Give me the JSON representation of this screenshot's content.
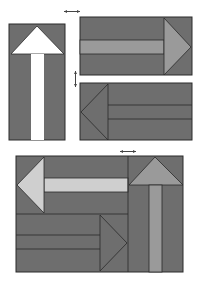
{
  "diagram": {
    "title": "",
    "colors": {
      "background": "#ffffff",
      "panel": "#6e6e6e",
      "outline": "#2a2a2a",
      "white_arrow": "#ffffff",
      "mid_arrow": "#9a9a9a",
      "light_arrow": "#cfcfcf",
      "marker": "#444444"
    },
    "panels": [
      {
        "id": "up-arrow-panel",
        "arrow": "up",
        "arrow_color": "white_arrow"
      },
      {
        "id": "right-arrow-panel",
        "arrow": "right",
        "arrow_color": "mid_arrow"
      },
      {
        "id": "left-arrow-panel",
        "arrow": "left",
        "arrow_color": "panel"
      },
      {
        "id": "assembled-panel",
        "arrows": [
          "left-light",
          "right-dark",
          "up-mid"
        ]
      }
    ],
    "markers": [
      {
        "id": "horizontal-join-marker-top",
        "orientation": "horizontal"
      },
      {
        "id": "vertical-join-marker",
        "orientation": "vertical"
      },
      {
        "id": "horizontal-join-marker-bottom",
        "orientation": "horizontal"
      }
    ]
  }
}
